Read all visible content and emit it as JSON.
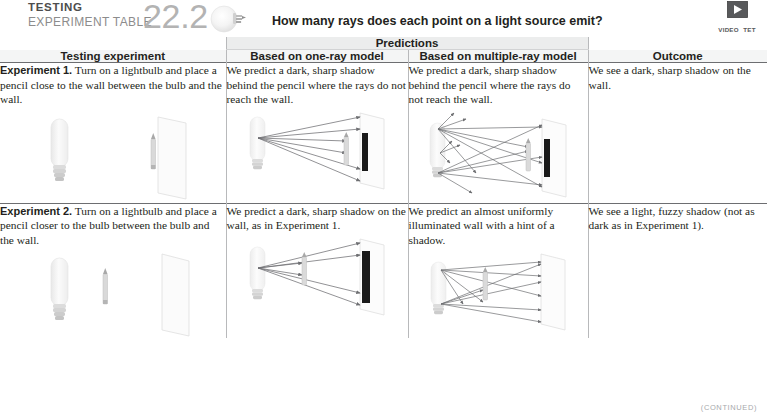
{
  "header": {
    "kicker_line1": "TESTING",
    "kicker_line2": "EXPERIMENT TABLE",
    "number": "22.2",
    "question": "How many rays does each point on a light source emit?",
    "video_label_line1": "VIDEO",
    "video_label_line2": "TET 22.2",
    "bulb_icon": "lightbulb-icon",
    "play_icon": "play-icon"
  },
  "table": {
    "group_header": "Predictions",
    "columns": [
      "Testing experiment",
      "Based on one-ray model",
      "Based on multiple-ray model",
      "Outcome"
    ],
    "rows": [
      {
        "experiment_label": "Experiment 1.",
        "experiment_text": " Turn on a lightbulb and place a pencil close to the wall between the bulb and the wall.",
        "one_ray_text": "We predict a dark, sharp shadow behind the pencil where the rays do not reach the wall.",
        "multi_ray_text": "We predict a dark, sharp shadow behind the pencil where the rays do not reach the wall.",
        "outcome_text": "We see a dark, sharp shadow on the wall."
      },
      {
        "experiment_label": "Experiment 2.",
        "experiment_text": " Turn on a lightbulb and place a pencil closer to the bulb between the bulb and the wall.",
        "one_ray_text": "We predict a dark, sharp shadow on the wall, as in Experiment 1.",
        "multi_ray_text": "We predict an almost uniformly illuminated wall with a hint of a shadow.",
        "outcome_text": "We see a light, fuzzy shadow (not as dark as in Experiment 1)."
      }
    ]
  },
  "footer": {
    "continued": "(CONTINUED)"
  },
  "colors": {
    "rule": "#6d6e71",
    "band": "#eceded",
    "divider": "#b8b9bb",
    "shadow_dark": "#1a1a1a",
    "ray": "#6d6e71",
    "text": "#231f20"
  }
}
